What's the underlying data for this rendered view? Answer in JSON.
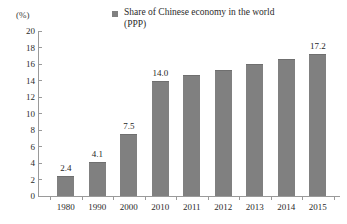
{
  "chart_data": {
    "type": "bar",
    "title": "",
    "subtitle": "",
    "xlabel": "",
    "ylabel": "(%)",
    "unit_label": "(%)",
    "legend": [
      {
        "name": "Share of Chinese economy in the world (PPP)",
        "color": "#808080"
      }
    ],
    "legend_position": "top-center",
    "grid": false,
    "ylim": [
      0,
      20
    ],
    "ytick_step": 2,
    "yticks": [
      "20",
      "18",
      "16",
      "14",
      "12",
      "10",
      "8",
      "6",
      "4",
      "2",
      "0"
    ],
    "categories": [
      "1980",
      "1990",
      "2000",
      "2010",
      "2011",
      "2012",
      "2013",
      "2014",
      "2015"
    ],
    "values": [
      2.4,
      4.1,
      7.5,
      14.0,
      14.7,
      15.3,
      16.0,
      16.6,
      17.2
    ],
    "data_labels": [
      "2.4",
      "4.1",
      "7.5",
      "14.0",
      "",
      "",
      "",
      "",
      "17.2"
    ],
    "bar_color": "#808080"
  },
  "colors": {
    "bar": "#808080",
    "axis": "#9a9a9a",
    "text": "#2b2b2b",
    "background": "#ffffff"
  }
}
